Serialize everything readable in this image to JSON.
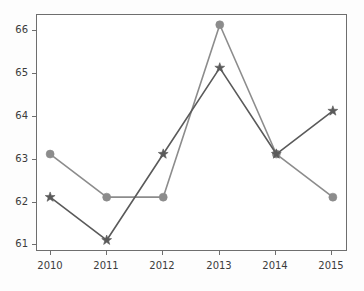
{
  "chart_data": {
    "type": "line",
    "title": "",
    "subtitle": "",
    "xlabel": "",
    "ylabel": "",
    "categories": [
      "2010",
      "2011",
      "2012",
      "2013",
      "2014",
      "2015"
    ],
    "x": [
      2010,
      2011,
      2012,
      2013,
      2014,
      2015
    ],
    "xlim": [
      2009.75,
      2015.25
    ],
    "ylim": [
      60.75,
      66.25
    ],
    "yticks": [
      61,
      62,
      63,
      64,
      65,
      66
    ],
    "ytick_labels": [
      "61",
      "62",
      "63",
      "64",
      "65",
      "66"
    ],
    "xticks": [
      2010,
      2011,
      2012,
      2013,
      2014,
      2015
    ],
    "xtick_labels": [
      "2010",
      "2011",
      "2012",
      "2013",
      "2014",
      "2015"
    ],
    "grid": false,
    "legend": "none",
    "series": [
      {
        "name": "series-circle",
        "marker": "circle",
        "color": "#8c8c8c",
        "values": [
          63,
          62,
          62,
          66,
          63,
          62
        ]
      },
      {
        "name": "series-star",
        "marker": "star",
        "color": "#5a5a5a",
        "values": [
          62,
          61,
          63,
          65,
          63,
          64
        ]
      }
    ]
  },
  "axes": {
    "frame_color": "#6e6e6e",
    "background": "#ffffff",
    "figure_background": "#fdfdfd"
  }
}
